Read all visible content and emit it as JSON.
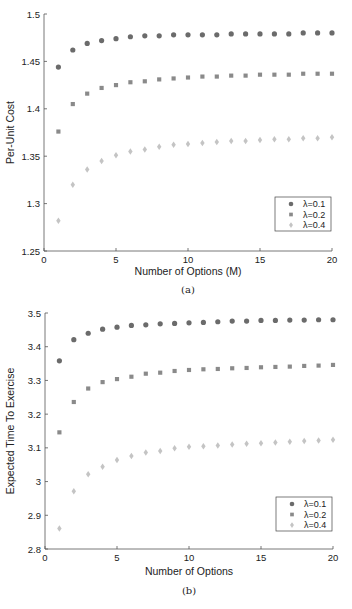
{
  "chart_data": [
    {
      "type": "scatter",
      "panel": "(a)",
      "title": "",
      "xlabel": "Number of Options (M)",
      "ylabel": "Per-Unit Cost",
      "xlim": [
        0,
        20
      ],
      "ylim": [
        1.25,
        1.5
      ],
      "xticks": [
        0,
        5,
        10,
        15,
        20
      ],
      "yticks": [
        1.25,
        1.3,
        1.35,
        1.4,
        1.45,
        1.5
      ],
      "ytick_labels": [
        "1.25",
        "1.3",
        "1.35",
        "1.4",
        "1.45",
        "1.5"
      ],
      "grid": false,
      "legend_position": "lower right",
      "x": [
        1,
        2,
        3,
        4,
        5,
        6,
        7,
        8,
        9,
        10,
        11,
        12,
        13,
        14,
        15,
        16,
        17,
        18,
        19,
        20
      ],
      "series": [
        {
          "name": "λ=0.1",
          "marker": "circle",
          "color": "#6b6b6b",
          "values": [
            1.444,
            1.462,
            1.469,
            1.472,
            1.474,
            1.476,
            1.477,
            1.477,
            1.478,
            1.478,
            1.478,
            1.478,
            1.479,
            1.479,
            1.479,
            1.479,
            1.479,
            1.48,
            1.48,
            1.48
          ]
        },
        {
          "name": "λ=0.2",
          "marker": "square",
          "color": "#8a8a8a",
          "values": [
            1.376,
            1.405,
            1.416,
            1.422,
            1.425,
            1.428,
            1.429,
            1.431,
            1.432,
            1.433,
            1.434,
            1.434,
            1.435,
            1.435,
            1.436,
            1.436,
            1.436,
            1.437,
            1.437,
            1.437
          ]
        },
        {
          "name": "λ=0.4",
          "marker": "diamond",
          "color": "#c4c4c4",
          "values": [
            1.282,
            1.32,
            1.336,
            1.345,
            1.351,
            1.355,
            1.357,
            1.36,
            1.362,
            1.363,
            1.364,
            1.365,
            1.366,
            1.366,
            1.367,
            1.368,
            1.368,
            1.369,
            1.369,
            1.37
          ]
        }
      ]
    },
    {
      "type": "scatter",
      "panel": "(b)",
      "title": "",
      "xlabel": "Number of Options",
      "ylabel": "Expected Time To Exercise",
      "xlim": [
        0,
        20
      ],
      "ylim": [
        2.8,
        3.5
      ],
      "xticks": [
        0,
        5,
        10,
        15,
        20
      ],
      "yticks": [
        2.8,
        2.9,
        3.0,
        3.1,
        3.2,
        3.3,
        3.4,
        3.5
      ],
      "ytick_labels": [
        "2.8",
        "2.9",
        "3",
        "3.1",
        "3.2",
        "3.3",
        "3.4",
        "3.5"
      ],
      "grid": false,
      "legend_position": "lower right",
      "x": [
        1,
        2,
        3,
        4,
        5,
        6,
        7,
        8,
        9,
        10,
        11,
        12,
        13,
        14,
        15,
        16,
        17,
        18,
        19,
        20
      ],
      "series": [
        {
          "name": "λ=0.1",
          "marker": "circle",
          "color": "#6b6b6b",
          "values": [
            3.358,
            3.421,
            3.44,
            3.452,
            3.458,
            3.463,
            3.465,
            3.468,
            3.469,
            3.471,
            3.472,
            3.474,
            3.476,
            3.476,
            3.478,
            3.478,
            3.479,
            3.479,
            3.48,
            3.48
          ]
        },
        {
          "name": "λ=0.2",
          "marker": "square",
          "color": "#8a8a8a",
          "values": [
            3.146,
            3.236,
            3.276,
            3.295,
            3.304,
            3.311,
            3.32,
            3.323,
            3.328,
            3.331,
            3.333,
            3.334,
            3.336,
            3.337,
            3.339,
            3.34,
            3.341,
            3.343,
            3.344,
            3.346
          ]
        },
        {
          "name": "λ=0.4",
          "marker": "diamond",
          "color": "#c4c4c4",
          "values": [
            2.861,
            2.971,
            3.022,
            3.044,
            3.064,
            3.076,
            3.086,
            3.091,
            3.099,
            3.103,
            3.105,
            3.107,
            3.11,
            3.112,
            3.114,
            3.116,
            3.118,
            3.12,
            3.122,
            3.124
          ]
        }
      ]
    }
  ],
  "captions": [
    "(a)",
    "(b)"
  ]
}
